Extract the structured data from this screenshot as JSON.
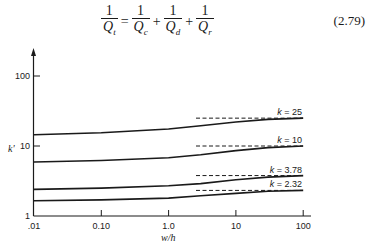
{
  "equation": {
    "lhs": {
      "num": "1",
      "den": "Q",
      "den_sub": "t"
    },
    "equals": "=",
    "terms": [
      {
        "num": "1",
        "den": "Q",
        "den_sub": "c"
      },
      {
        "num": "1",
        "den": "Q",
        "den_sub": "d"
      },
      {
        "num": "1",
        "den": "Q",
        "den_sub": "r"
      }
    ],
    "plus": "+",
    "number": "(2.79)"
  },
  "chart_data": {
    "type": "line",
    "title": "",
    "xlabel": "w/h",
    "ylabel": "k'",
    "xscale": "log",
    "yscale": "log",
    "xlim": [
      0.01,
      100
    ],
    "ylim": [
      1,
      100
    ],
    "x_ticks": [
      ".01",
      "0.10",
      "1.0",
      "10",
      "100"
    ],
    "y_ticks": [
      "1",
      "10",
      "100"
    ],
    "grid": false,
    "series": [
      {
        "name": "k = 25",
        "x": [
          0.01,
          0.1,
          1.0,
          3.0,
          10,
          30,
          100
        ],
        "y": [
          14.5,
          15.5,
          17.5,
          19.5,
          22,
          24,
          25
        ],
        "asymptote": 25
      },
      {
        "name": "k = 10",
        "x": [
          0.01,
          0.1,
          1.0,
          3.0,
          10,
          30,
          100
        ],
        "y": [
          5.9,
          6.2,
          6.8,
          7.5,
          8.6,
          9.5,
          10
        ],
        "asymptote": 10
      },
      {
        "name": "k = 3.78",
        "x": [
          0.01,
          0.1,
          1.0,
          3.0,
          10,
          30,
          100
        ],
        "y": [
          2.4,
          2.5,
          2.7,
          2.9,
          3.3,
          3.6,
          3.78
        ],
        "asymptote": 3.78
      },
      {
        "name": "k = 2.32",
        "x": [
          0.01,
          0.1,
          1.0,
          3.0,
          10,
          30,
          100
        ],
        "y": [
          1.65,
          1.7,
          1.8,
          1.95,
          2.1,
          2.25,
          2.32
        ],
        "asymptote": 2.32
      }
    ],
    "annotations": [
      "k = 25",
      "k = 10",
      "k = 3.78",
      "k = 2.32"
    ],
    "asymptote_style": "dashed lines from w/h ≈ 3 to 100"
  }
}
